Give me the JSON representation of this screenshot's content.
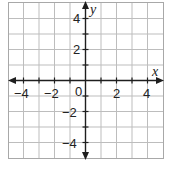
{
  "graph": {
    "type": "coordinate-plane",
    "x_axis_label": "x",
    "y_axis_label": "y",
    "origin_label": "0",
    "x_range": [
      -5,
      5
    ],
    "y_range": [
      -5,
      5
    ],
    "grid_step": 1,
    "x_tick_labels": [
      {
        "value": -4,
        "text": "−4"
      },
      {
        "value": -2,
        "text": "−2"
      },
      {
        "value": 2,
        "text": "2"
      },
      {
        "value": 4,
        "text": "4"
      }
    ],
    "y_tick_labels": [
      {
        "value": 4,
        "text": "4"
      },
      {
        "value": 2,
        "text": "2"
      },
      {
        "value": -2,
        "text": "−2"
      },
      {
        "value": -4,
        "text": "−4"
      }
    ],
    "colors": {
      "grid": "#bdbdbd",
      "axis": "#1e1e1e",
      "background": "#ffffff"
    }
  }
}
